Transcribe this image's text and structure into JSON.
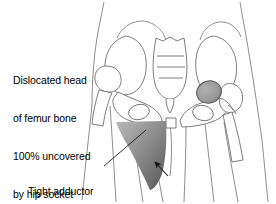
{
  "figure": {
    "width": 276,
    "height": 204,
    "background_color": "#ffffff"
  },
  "annotations": {
    "dislocation_label": {
      "text": "Dislocated head\nof femur bone\n100% uncovered\nby hip socket",
      "lines": [
        "Dislocated head",
        "of femur bone",
        "100% uncovered",
        "by hip socket"
      ],
      "color": "#000000"
    },
    "adductor_label": {
      "text": "Tight adductor\nmuscles",
      "lines": [
        "Tight adductor",
        "muscles"
      ],
      "color": "#000000"
    }
  },
  "anatomy": {
    "body_outline_color": "#8a8a8a",
    "bone_outline_color": "#6e6e6e",
    "femoral_head": {
      "name": "dislocated-femoral-head",
      "fill_color": "#9b9b9b",
      "stroke_color": "#555555",
      "state": "100% uncovered by hip socket"
    },
    "adductor_muscle": {
      "name": "tight-adductor-muscle-wedge",
      "fill_gradient_from": "#b4b4b4",
      "fill_gradient_to": "#5f5f5f",
      "side": "left"
    },
    "leader_line_color": "#1a1a1a",
    "arrow_color": "#111111"
  }
}
